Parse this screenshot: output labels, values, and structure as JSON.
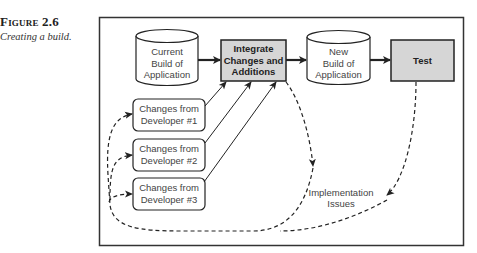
{
  "figure": {
    "label": "Figure 2.6",
    "title": "Creating a build."
  },
  "diagram": {
    "nodes": {
      "current_build": {
        "type": "cylinder",
        "lines": [
          "Current",
          "Build of",
          "Application"
        ]
      },
      "integrate": {
        "type": "process-shaded",
        "lines": [
          "Integrate",
          "Changes and",
          "Additions"
        ]
      },
      "new_build": {
        "type": "cylinder",
        "lines": [
          "New",
          "Build of",
          "Application"
        ]
      },
      "test": {
        "type": "process-shaded",
        "lines": [
          "Test"
        ]
      },
      "dev1": {
        "type": "rounded-box",
        "lines": [
          "Changes from",
          "Developer #1"
        ]
      },
      "dev2": {
        "type": "rounded-box",
        "lines": [
          "Changes from",
          "Developer #2"
        ]
      },
      "dev3": {
        "type": "rounded-box",
        "lines": [
          "Changes from",
          "Developer #3"
        ]
      },
      "issues": {
        "type": "label",
        "lines": [
          "Implementation",
          "Issues"
        ]
      }
    },
    "edges": [
      {
        "from": "current_build",
        "to": "integrate",
        "style": "solid-thick"
      },
      {
        "from": "integrate",
        "to": "new_build",
        "style": "solid-thick"
      },
      {
        "from": "new_build",
        "to": "test",
        "style": "solid-thick"
      },
      {
        "from": "dev1",
        "to": "integrate",
        "style": "solid"
      },
      {
        "from": "dev2",
        "to": "integrate",
        "style": "solid"
      },
      {
        "from": "dev3",
        "to": "integrate",
        "style": "solid"
      },
      {
        "from": "integrate",
        "to": "issues",
        "style": "dashed"
      },
      {
        "from": "test",
        "to": "issues",
        "style": "dashed"
      },
      {
        "from": "issues",
        "to": "dev1",
        "style": "dashed"
      },
      {
        "from": "issues",
        "to": "dev2",
        "style": "dashed"
      },
      {
        "from": "issues",
        "to": "dev3",
        "style": "dashed"
      }
    ],
    "colors": {
      "shaded_fill": "#d6d6d6",
      "stroke": "#222222",
      "frame": "#333333"
    }
  }
}
